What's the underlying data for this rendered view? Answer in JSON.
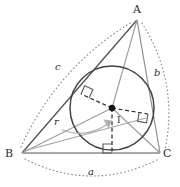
{
  "figure": {
    "background": "#ffffff",
    "width": 180,
    "height": 187,
    "colors": {
      "triangle_stroke": "#4a4a4a",
      "cevian_stroke": "#9a9a9a",
      "circle_stroke": "#3d3d3d",
      "radius_dashed": "#3d3d3d",
      "arc_dotted": "#7d7d7d",
      "arrow": "#a8a8a8",
      "incenter_dot": "#1a1a1a",
      "right_angle": "#5a5a5a",
      "label_text": "#2b2b2b",
      "baseline": "#8c8c8c"
    }
  },
  "vertices": {
    "A": {
      "label": "A",
      "x": 137,
      "y": 20,
      "text_x": 133,
      "text_y": 4
    },
    "B": {
      "label": "B",
      "x": 22,
      "y": 153,
      "text_x": 5,
      "text_y": 148
    },
    "C": {
      "label": "C",
      "x": 160,
      "y": 153,
      "text_x": 163,
      "text_y": 148
    }
  },
  "incenter": {
    "label": "I",
    "x": 112,
    "y": 108,
    "text_x": 117,
    "text_y": 116,
    "dot_radius": 3.2
  },
  "incircle": {
    "center_x": 112,
    "center_y": 108,
    "radius": 42
  },
  "radius": {
    "label": "r",
    "text_x": 54,
    "text_y": 117
  },
  "sides": [
    {
      "name": "a",
      "label": "a",
      "opposite_vertex": "A",
      "between": "BC",
      "text_x": 88,
      "text_y": 167
    },
    {
      "name": "b",
      "label": "b",
      "opposite_vertex": "B",
      "between": "CA",
      "text_x": 154,
      "text_y": 68
    },
    {
      "name": "c",
      "label": "c",
      "opposite_vertex": "C",
      "between": "AB",
      "text_x": 55,
      "text_y": 62
    }
  ],
  "tangent_points": [
    {
      "side": "AB",
      "x": 81,
      "y": 94,
      "right_angle": true
    },
    {
      "side": "AC",
      "x": 148,
      "y": 114,
      "right_angle": true
    },
    {
      "side": "BC",
      "x": 112,
      "y": 153,
      "right_angle": true
    }
  ]
}
